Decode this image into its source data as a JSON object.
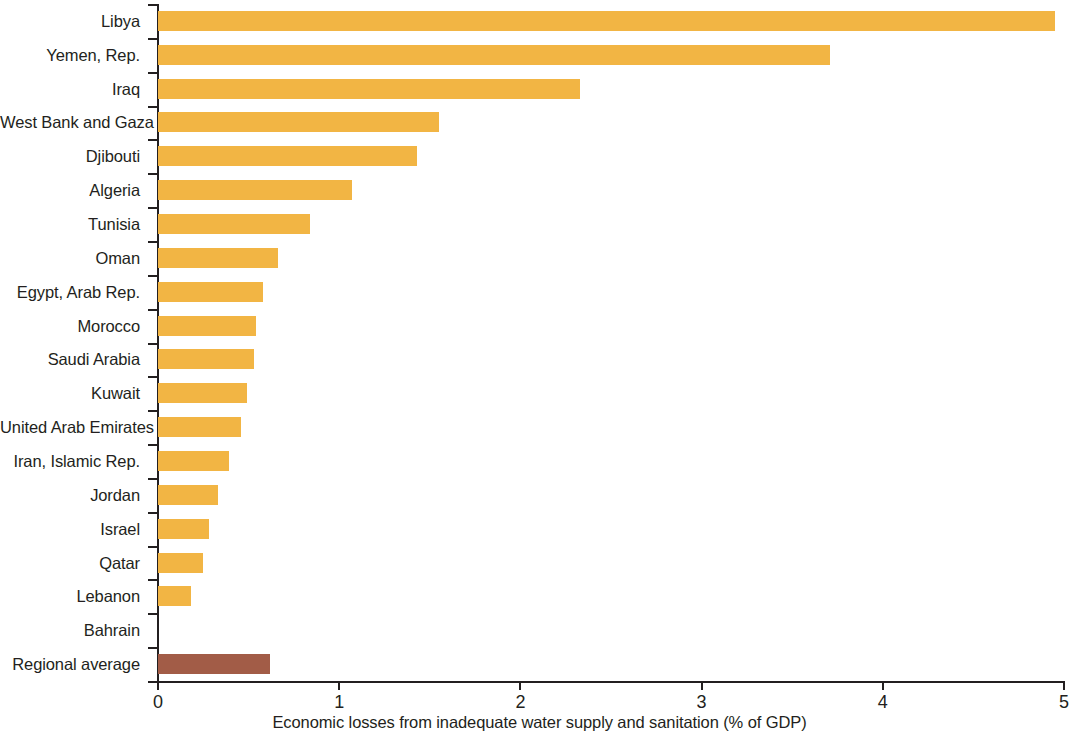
{
  "chart_data": {
    "type": "bar",
    "orientation": "horizontal",
    "title": "",
    "subtitle": "",
    "xlabel": "Economic losses from inadequate water supply and sanitation (% of GDP)",
    "ylabel": "",
    "xlim": [
      0,
      5
    ],
    "xticks": [
      "0",
      "1",
      "2",
      "3",
      "4",
      "5"
    ],
    "xtick_values": [
      0,
      1,
      2,
      3,
      4,
      5
    ],
    "grid": false,
    "legend": null,
    "categories": [
      "Libya",
      "Yemen, Rep.",
      "Iraq",
      "West Bank and Gaza",
      "Djibouti",
      "Algeria",
      "Tunisia",
      "Oman",
      "Egypt, Arab Rep.",
      "Morocco",
      "Saudi Arabia",
      "Kuwait",
      "United Arab Emirates",
      "Iran, Islamic Rep.",
      "Jordan",
      "Israel",
      "Qatar",
      "Lebanon",
      "Bahrain",
      "Regional average"
    ],
    "values": [
      4.95,
      3.71,
      2.33,
      1.55,
      1.43,
      1.07,
      0.84,
      0.66,
      0.58,
      0.54,
      0.53,
      0.49,
      0.46,
      0.39,
      0.33,
      0.28,
      0.25,
      0.18,
      0.0,
      0.62
    ],
    "colors": {
      "bar": "#f2b544",
      "highlight": "#a25c47",
      "axis": "#231f20",
      "background": "#ffffff"
    },
    "highlight_category": "Regional average"
  }
}
